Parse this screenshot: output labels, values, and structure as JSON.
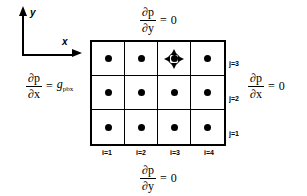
{
  "figure": {
    "background_color": "#ffffff",
    "line_color": "#000000"
  },
  "axes": {
    "y_label": "y",
    "x_label": "x"
  },
  "grid": {
    "columns": 4,
    "rows": 3,
    "i_labels": [
      "i=1",
      "i=2",
      "i=3",
      "i=4"
    ],
    "j_labels": [
      "j=3",
      "j=2",
      "j=1"
    ],
    "cells": [
      {
        "i": 1,
        "j": 3,
        "node": "dot",
        "marked": false
      },
      {
        "i": 2,
        "j": 3,
        "node": "dot",
        "marked": false
      },
      {
        "i": 3,
        "j": 3,
        "node": "dot",
        "marked": true
      },
      {
        "i": 4,
        "j": 3,
        "node": "dot",
        "marked": false
      },
      {
        "i": 1,
        "j": 2,
        "node": "dot",
        "marked": false
      },
      {
        "i": 2,
        "j": 2,
        "node": "dot",
        "marked": false
      },
      {
        "i": 3,
        "j": 2,
        "node": "dot",
        "marked": false
      },
      {
        "i": 4,
        "j": 2,
        "node": "dot",
        "marked": false
      },
      {
        "i": 1,
        "j": 1,
        "node": "dot",
        "marked": false
      },
      {
        "i": 2,
        "j": 1,
        "node": "dot",
        "marked": false
      },
      {
        "i": 3,
        "j": 1,
        "node": "dot",
        "marked": false
      },
      {
        "i": 4,
        "j": 1,
        "node": "dot",
        "marked": false
      }
    ]
  },
  "boundary_conditions": {
    "top": {
      "numerator": "∂p",
      "denominator": "∂y",
      "equals": "=",
      "value": "0"
    },
    "bottom": {
      "numerator": "∂p",
      "denominator": "∂y",
      "equals": "=",
      "value": "0"
    },
    "left": {
      "numerator": "∂p",
      "denominator": "∂x",
      "equals": "=",
      "value": "g",
      "value_subscript": "pbx"
    },
    "right": {
      "numerator": "∂p",
      "denominator": "∂x",
      "equals": "=",
      "value": "0"
    }
  }
}
